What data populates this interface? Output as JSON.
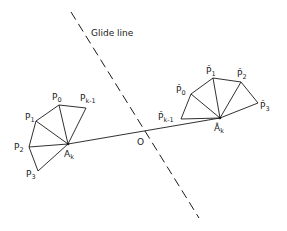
{
  "diagram": {
    "glide_line": {
      "label": "Glide line",
      "from": [
        71,
        12
      ],
      "to": [
        199,
        218
      ]
    },
    "center": {
      "label": "O",
      "pos": [
        141,
        142
      ]
    },
    "connector": {
      "from": "Ak",
      "to": "Ak_hat"
    },
    "left_fan": {
      "apex": {
        "id": "Ak",
        "label": "A",
        "sub": "k",
        "pos": [
          68,
          144
        ]
      },
      "points": [
        {
          "id": "P0",
          "label": "P",
          "sub": "0",
          "pos": [
            59,
            105
          ]
        },
        {
          "id": "Pk1",
          "label": "P",
          "sub": "k-1",
          "pos": [
            86,
            108
          ]
        },
        {
          "id": "P1",
          "label": "P",
          "sub": "1",
          "pos": [
            36,
            121
          ]
        },
        {
          "id": "P2",
          "label": "P",
          "sub": "2",
          "pos": [
            29,
            147
          ]
        },
        {
          "id": "P3",
          "label": "P",
          "sub": "3",
          "pos": [
            38,
            171
          ]
        }
      ]
    },
    "right_fan": {
      "apex": {
        "id": "Ak_hat",
        "label": "Â",
        "sub": "k",
        "pos": [
          220,
          118
        ]
      },
      "points": [
        {
          "id": "P0_hat",
          "label": "P̂",
          "sub": "0",
          "pos": [
            191,
            94
          ]
        },
        {
          "id": "P1_hat",
          "label": "P̂",
          "sub": "1",
          "pos": [
            213,
            78
          ]
        },
        {
          "id": "P2_hat",
          "label": "P̂",
          "sub": "2",
          "pos": [
            241,
            82
          ]
        },
        {
          "id": "P3_hat",
          "label": "P̂",
          "sub": "3",
          "pos": [
            258,
            103
          ]
        },
        {
          "id": "Pk1_hat",
          "label": "P̂",
          "sub": "k-1",
          "pos": [
            181,
            119
          ]
        }
      ]
    }
  },
  "labels": {
    "glide_line": "Glide line",
    "O": "O",
    "P0": "P",
    "P0_sub": "0",
    "Pk1": "P",
    "Pk1_sub": "k-1",
    "P1": "P",
    "P1_sub": "1",
    "P2": "P",
    "P2_sub": "2",
    "P3": "P",
    "P3_sub": "3",
    "Ak": "A",
    "Ak_sub": "k",
    "P0h": "P̂",
    "P0h_sub": "0",
    "P1h": "P̂",
    "P1h_sub": "1",
    "P2h": "P̂",
    "P2h_sub": "2",
    "P3h": "P̂",
    "P3h_sub": "3",
    "Pk1h": "P̂",
    "Pk1h_sub": "k-1",
    "Akh": "Â",
    "Akh_sub": "k"
  }
}
